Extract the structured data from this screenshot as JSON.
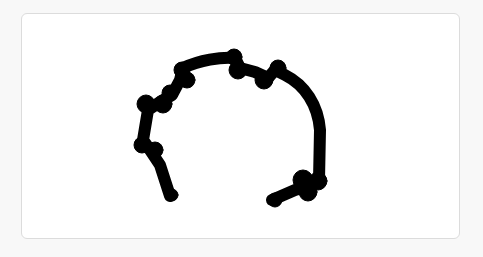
{
  "canvas": {
    "label": "",
    "background": "#ffffff",
    "border_color": "#dcdcdc",
    "page_background": "#f8f8f8"
  },
  "drawing": {
    "stroke_color": "#000000",
    "shape": "hand-drawn arch stroke",
    "stroke_width": 13
  }
}
